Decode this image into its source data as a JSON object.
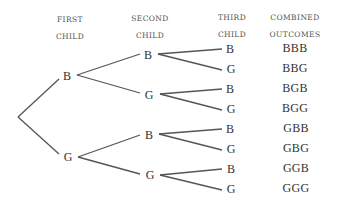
{
  "headers": {
    "first": [
      "FIRST",
      "CHILD"
    ],
    "second": [
      "SECOND",
      "CHILD"
    ],
    "third": [
      "THIRD",
      "CHILD"
    ],
    "combined": [
      "COMBINED",
      "OUTCOMES"
    ]
  },
  "tree": {
    "first": [
      "B",
      "G"
    ],
    "second": [
      "B",
      "G",
      "B",
      "G"
    ],
    "third": [
      "B",
      "G",
      "B",
      "G",
      "B",
      "G",
      "B",
      "G"
    ]
  },
  "outcomes": [
    "BBB",
    "BBG",
    "BGB",
    "BGG",
    "GBB",
    "GBG",
    "GGB",
    "GGG"
  ],
  "colors": {
    "line": "#555555",
    "text": "#333333"
  }
}
